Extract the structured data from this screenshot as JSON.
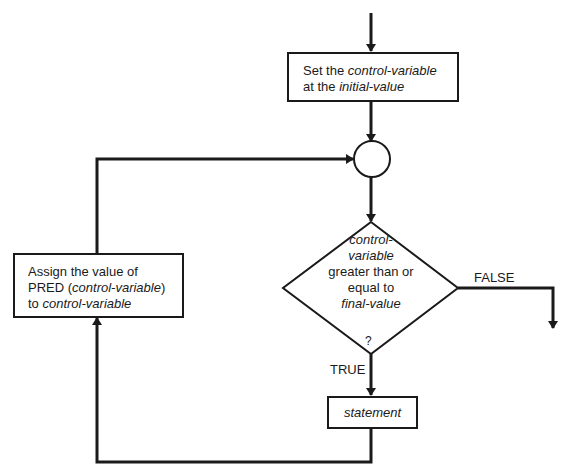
{
  "diagram": {
    "type": "flowchart",
    "nodes": {
      "init": {
        "shape": "rectangle",
        "line1": {
          "prefix": "Set the ",
          "italic": "control-variable"
        },
        "line2": {
          "prefix": "at the ",
          "italic": "initial-value"
        }
      },
      "junction": {
        "shape": "circle"
      },
      "decision": {
        "shape": "diamond",
        "line1_italic": "control-",
        "line2_italic": "variable",
        "line3": "greater than or",
        "line4": "equal to",
        "line5_italic": "final-value",
        "question_mark": "?"
      },
      "statement": {
        "shape": "rectangle",
        "italic": "statement"
      },
      "update": {
        "shape": "rectangle",
        "line1": "Assign the value of",
        "line2_prefix": "PRED (",
        "line2_italic": "control-variable",
        "line2_suffix": ")",
        "line3_prefix": "to ",
        "line3_italic": "control-variable"
      }
    },
    "edge_labels": {
      "false": "FALSE",
      "true": "TRUE"
    },
    "edges": [
      {
        "from": "entry",
        "to": "init"
      },
      {
        "from": "init",
        "to": "junction"
      },
      {
        "from": "junction",
        "to": "decision"
      },
      {
        "from": "decision",
        "to": "exit",
        "label": "FALSE"
      },
      {
        "from": "decision",
        "to": "statement",
        "label": "TRUE"
      },
      {
        "from": "statement",
        "to": "update"
      },
      {
        "from": "update",
        "to": "junction"
      }
    ],
    "colors": {
      "line": "#1a1a1a",
      "background": "#ffffff"
    }
  }
}
